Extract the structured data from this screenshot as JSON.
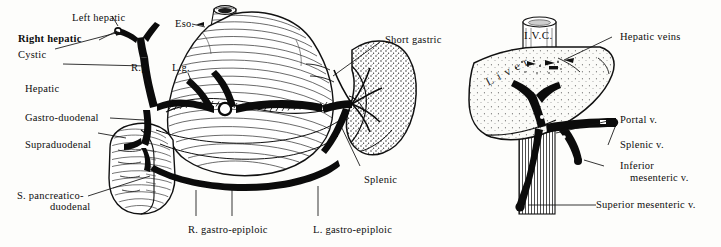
{
  "figure": {
    "background_color": "#fdfdfb",
    "ink_color": "#0d0d0d",
    "panels": [
      {
        "id": "left",
        "name": "celiac-arterial-panel"
      },
      {
        "id": "right",
        "name": "portal-venous-panel"
      }
    ]
  },
  "labels": {
    "left_panel": [
      {
        "key": "left_hepatic",
        "text": "Left hepatic",
        "bold": false
      },
      {
        "key": "right_hepatic",
        "text": "Right hepatic",
        "bold": true
      },
      {
        "key": "cystic",
        "text": "Cystic",
        "bold": false
      },
      {
        "key": "hepatic",
        "text": "Hepatic",
        "bold": false
      },
      {
        "key": "gastro_duodenal",
        "text": "Gastro-duodenal",
        "bold": false
      },
      {
        "key": "supraduodenal",
        "text": "Supraduodenal",
        "bold": false
      },
      {
        "key": "s_pancreaticoduodenal_l1",
        "text": "S. pancreatico-",
        "bold": false
      },
      {
        "key": "s_pancreaticoduodenal_l2",
        "text": "duodenal",
        "bold": false
      },
      {
        "key": "eso",
        "text": "Eso.",
        "bold": false
      },
      {
        "key": "rg",
        "text": "R.g.",
        "bold": false
      },
      {
        "key": "lg",
        "text": "L.g.",
        "bold": false
      },
      {
        "key": "short_gastric",
        "text": "Short gastric",
        "bold": false
      },
      {
        "key": "splenic",
        "text": "Splenic",
        "bold": false
      },
      {
        "key": "r_gastro_epiploic",
        "text": "R. gastro-epiploic",
        "bold": false
      },
      {
        "key": "l_gastro_epiploic",
        "text": "L. gastro-epiploic",
        "bold": false
      }
    ],
    "right_panel": [
      {
        "key": "hepatic_veins",
        "text": "Hepatic veins",
        "bold": false
      },
      {
        "key": "portal_v",
        "text": "Portal v.",
        "bold": false
      },
      {
        "key": "splenic_v",
        "text": "Splenic v.",
        "bold": false
      },
      {
        "key": "inferior_mes_l1",
        "text": "Inferior",
        "bold": false
      },
      {
        "key": "inferior_mes_l2",
        "text": "mesenteric v.",
        "bold": false
      },
      {
        "key": "superior_mes_v",
        "text": "Superior mesenteric v.",
        "bold": false
      }
    ],
    "in_figure": [
      {
        "key": "ivc",
        "text": "I.V.C.",
        "bold": false
      },
      {
        "key": "liver",
        "text": "Liver",
        "bold": false
      }
    ]
  },
  "structures": {
    "left_panel": [
      "esophagus",
      "stomach",
      "spleen",
      "duodenum",
      "celiac-trunk",
      "hepatic-artery",
      "splenic-artery",
      "gastro-epiploic-arcade"
    ],
    "right_panel": [
      "inferior-vena-cava",
      "liver",
      "portal-vein",
      "splenic-vein",
      "superior-mesenteric-vein",
      "inferior-mesenteric-vein"
    ]
  }
}
